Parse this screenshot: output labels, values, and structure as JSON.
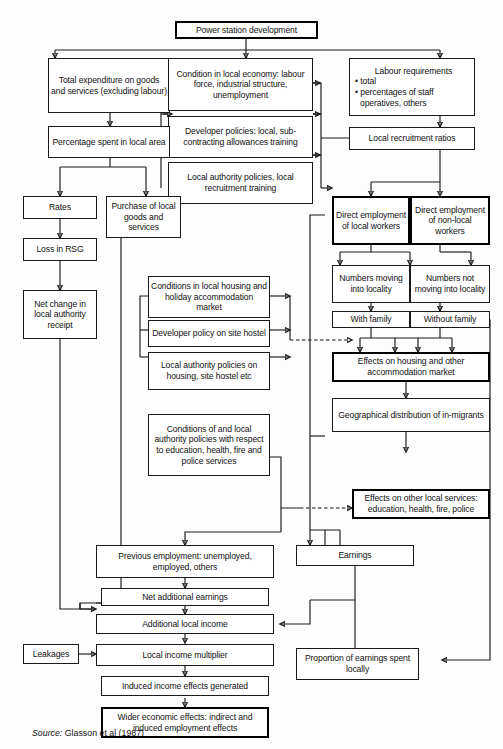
{
  "diagram": {
    "source_prefix": "Source:",
    "source_text": "Glasson et al (1987)",
    "nodes": {
      "power_station": "Power station development",
      "total_expenditure": "Total expenditure on goods and services (excluding labour)",
      "condition_local_economy": "Condition in local economy: labour force, industrial structure, unemployment",
      "labour_req_head": "Labour requirements",
      "labour_req_b1": "• total",
      "labour_req_b2": "• percentages of staff",
      "labour_req_b3": "operatives, others",
      "developer_policies": "Developer policies: local, sub-contracting allowances training",
      "local_authority_policies": "Local authority policies, local recruitment training",
      "percentage_spent": "Percentage spent in local area",
      "local_recruitment_ratios": "Local recruitment ratios",
      "rates": "Rates",
      "purchase_local_goods": "Purchase of local goods and services",
      "direct_local": "Direct employment of local workers",
      "direct_nonlocal": "Direct employment of non-local workers",
      "loss_rsg": "Loss in RSG",
      "numbers_moving": "Numbers moving into locality",
      "numbers_not_moving": "Numbers not moving into locality",
      "conditions_housing": "Conditions in local housing and holiday accommodation market",
      "net_change": "Net change in local authority receipt",
      "with_family": "With family",
      "without_family": "Without family",
      "developer_hostel": "Developer policy on site hostel",
      "effects_housing": "Effects on housing and other accommodation market",
      "la_housing_hostel": "Local authority policies on housing, site hostel etc",
      "geographical_distribution": "Geographical distribution of in-migrants",
      "conditions_education": "Conditions of and local authority policies with respect to education, health, fire and police services",
      "effects_other_services": "Effects on other local services: education, health, fire, police",
      "previous_employment": "Previous employment: unemployed, employed, others",
      "net_additional_earnings": "Net additional earnings",
      "earnings": "Earnings",
      "additional_local_income": "Additional local income",
      "leakages": "Leakages",
      "local_income_multiplier": "Local income multiplier",
      "proportion_earnings": "Proportion of earnings spent locally",
      "induced_income": "Induced income effects generated",
      "wider_economic": "Wider economic effects: indirect and induced employment effects"
    },
    "colors": {
      "stroke": "#1a1a1a",
      "box_fill": "#ffffff",
      "background": "#fdfdfd",
      "text": "#111111"
    }
  }
}
